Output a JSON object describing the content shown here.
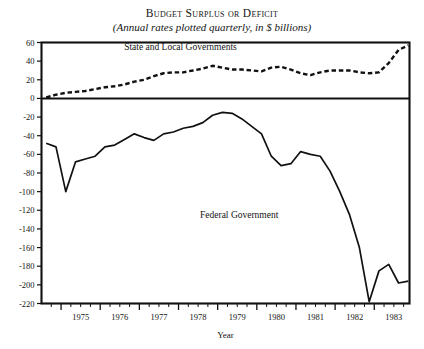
{
  "chart_data": {
    "type": "line",
    "title": "Budget Surplus or Deficit",
    "subtitle": "(Annual rates plotted quarterly, in $ billions)",
    "xlabel": "Year",
    "ylabel": "",
    "xlim": [
      1974.5,
      1983.9
    ],
    "ylim": [
      -220,
      60
    ],
    "ytick_step": 20,
    "yticks": [
      60,
      40,
      20,
      0,
      -20,
      -40,
      -60,
      -80,
      -100,
      -120,
      -140,
      -160,
      -180,
      -200,
      -220
    ],
    "ytick_labels": [
      "60",
      "40",
      "20",
      "0",
      "-20",
      "-40",
      "-60",
      "-80",
      "-100",
      "-120",
      "-140",
      "-160",
      "-180",
      "-200",
      "-220"
    ],
    "xticks": [
      1975,
      1976,
      1977,
      1978,
      1979,
      1980,
      1981,
      1982,
      1983
    ],
    "xtick_labels": [
      "1975",
      "1976",
      "1977",
      "1978",
      "1979",
      "1980",
      "1981",
      "1982",
      "1983"
    ],
    "minor_xtick_interval_quarters": 1,
    "grid": false,
    "legend_position": "inline-annotation",
    "zero_line": 0,
    "series": [
      {
        "name": "State and Local Governments",
        "style": "dashed",
        "label_x": 1978.05,
        "label_y": 52,
        "x": [
          1974.62,
          1974.87,
          1975.12,
          1975.37,
          1975.62,
          1975.87,
          1976.12,
          1976.37,
          1976.62,
          1976.87,
          1977.12,
          1977.37,
          1977.62,
          1977.87,
          1978.12,
          1978.37,
          1978.62,
          1978.87,
          1979.12,
          1979.37,
          1979.62,
          1979.87,
          1980.12,
          1980.37,
          1980.62,
          1980.87,
          1981.12,
          1981.37,
          1981.62,
          1981.87,
          1982.12,
          1982.37,
          1982.62,
          1982.87,
          1983.12,
          1983.37,
          1983.62,
          1983.87
        ],
        "values": [
          1,
          4,
          6,
          7,
          8,
          10,
          12,
          13,
          15,
          18,
          20,
          24,
          27,
          28,
          28,
          30,
          32,
          35,
          33,
          31,
          31,
          30,
          29,
          33,
          34,
          31,
          27,
          25,
          28,
          30,
          30,
          30,
          28,
          27,
          28,
          38,
          52,
          57
        ]
      },
      {
        "name": "Federal Government",
        "style": "solid",
        "label_x": 1979.55,
        "label_y": -128,
        "x": [
          1974.62,
          1974.87,
          1975.12,
          1975.37,
          1975.62,
          1975.87,
          1976.12,
          1976.37,
          1976.62,
          1976.87,
          1977.12,
          1977.37,
          1977.62,
          1977.87,
          1978.12,
          1978.37,
          1978.62,
          1978.87,
          1979.12,
          1979.37,
          1979.62,
          1979.87,
          1980.12,
          1980.37,
          1980.62,
          1980.87,
          1981.12,
          1981.37,
          1981.62,
          1981.87,
          1982.12,
          1982.37,
          1982.62,
          1982.87,
          1983.12,
          1983.37,
          1983.62,
          1983.87
        ],
        "values": [
          -48,
          -52,
          -100,
          -68,
          -65,
          -62,
          -52,
          -50,
          -44,
          -38,
          -42,
          -45,
          -38,
          -36,
          -32,
          -30,
          -26,
          -18,
          -15,
          -16,
          -22,
          -30,
          -38,
          -62,
          -72,
          -70,
          -57,
          -60,
          -62,
          -78,
          -100,
          -125,
          -160,
          -218,
          -185,
          -178,
          -198,
          -196
        ]
      }
    ]
  }
}
